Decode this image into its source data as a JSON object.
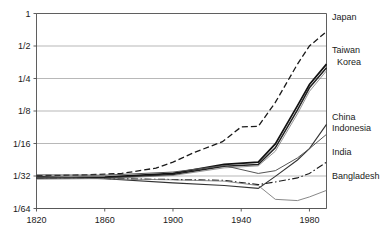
{
  "chart_data": {
    "type": "line",
    "title": "",
    "subtitle": "",
    "xlabel": "",
    "ylabel": "",
    "yscale": "log2",
    "xlim": [
      1820,
      1990
    ],
    "ylim": [
      0.015625,
      1
    ],
    "grid": true,
    "legend_position": "right-inline",
    "y_tick_labels": [
      "1",
      "1/2",
      "1/4",
      "1/8",
      "1/16",
      "1/32",
      "1/64"
    ],
    "y_tick_values": [
      1,
      0.5,
      0.25,
      0.125,
      0.0625,
      0.03125,
      0.015625
    ],
    "x_tick_labels": [
      "1820",
      "1860",
      "1900",
      "1940",
      "1980"
    ],
    "x_tick_values": [
      1820,
      1860,
      1900,
      1940,
      1980
    ],
    "series": [
      {
        "name": "Japan",
        "label": "Japan",
        "style": "dashed",
        "color": "#1a1a1a",
        "width": 1.3,
        "dash": "6,3",
        "label_x": 332,
        "label_y": 20,
        "x": [
          1820,
          1850,
          1870,
          1890,
          1900,
          1913,
          1929,
          1940,
          1950,
          1960,
          1973,
          1980,
          1990
        ],
        "y": [
          0.0315,
          0.032,
          0.033,
          0.037,
          0.042,
          0.052,
          0.065,
          0.089,
          0.09,
          0.15,
          0.34,
          0.5,
          0.68
        ]
      },
      {
        "name": "Taiwan",
        "label": "Taiwan",
        "style": "solid-heavy",
        "color": "#111111",
        "width": 1.7,
        "dash": "none",
        "label_x": 332,
        "label_y": 53,
        "x": [
          1820,
          1860,
          1900,
          1930,
          1950,
          1960,
          1973,
          1980,
          1990
        ],
        "y": [
          0.03,
          0.0305,
          0.033,
          0.04,
          0.042,
          0.062,
          0.14,
          0.22,
          0.34
        ]
      },
      {
        "name": "Korea",
        "label": "Korea",
        "style": "solid-heavy",
        "color": "#222222",
        "width": 1.5,
        "dash": "none",
        "label_x": 337,
        "label_y": 65,
        "x": [
          1820,
          1860,
          1900,
          1930,
          1950,
          1960,
          1973,
          1980,
          1990
        ],
        "y": [
          0.0298,
          0.03,
          0.0322,
          0.0385,
          0.04,
          0.057,
          0.128,
          0.205,
          0.315
        ]
      },
      {
        "name": "Korea-thin",
        "label": "",
        "style": "solid-thin",
        "color": "#7a7a7a",
        "width": 0.8,
        "dash": "none",
        "label_x": 0,
        "label_y": 0,
        "x": [
          1820,
          1860,
          1900,
          1930,
          1950,
          1960,
          1973,
          1980,
          1990
        ],
        "y": [
          0.0292,
          0.0296,
          0.0316,
          0.0372,
          0.0388,
          0.053,
          0.118,
          0.19,
          0.295
        ]
      },
      {
        "name": "China",
        "label": "China",
        "style": "solid",
        "color": "#333333",
        "width": 1.1,
        "dash": "none",
        "label_x": 332,
        "label_y": 120,
        "x": [
          1820,
          1860,
          1900,
          1930,
          1950,
          1960,
          1973,
          1980,
          1990
        ],
        "y": [
          0.031,
          0.0295,
          0.027,
          0.0255,
          0.024,
          0.031,
          0.044,
          0.056,
          0.094
        ]
      },
      {
        "name": "Indonesia",
        "label": "Indonesia",
        "style": "solid",
        "color": "#555555",
        "width": 1.0,
        "dash": "none",
        "label_x": 332,
        "label_y": 131,
        "x": [
          1820,
          1860,
          1900,
          1930,
          1950,
          1960,
          1973,
          1980,
          1990
        ],
        "y": [
          0.032,
          0.0318,
          0.034,
          0.039,
          0.033,
          0.035,
          0.046,
          0.056,
          0.076
        ]
      },
      {
        "name": "India",
        "label": "India",
        "style": "dash-dot",
        "color": "#1a1a1a",
        "width": 1.1,
        "dash": "7,2.5,1.5,2.5",
        "label_x": 332,
        "label_y": 155,
        "x": [
          1820,
          1860,
          1900,
          1930,
          1950,
          1960,
          1973,
          1980,
          1990
        ],
        "y": [
          0.03,
          0.0296,
          0.029,
          0.0285,
          0.026,
          0.0275,
          0.03,
          0.033,
          0.042
        ]
      },
      {
        "name": "Bangladesh",
        "label": "Bangladesh",
        "style": "solid-light",
        "color": "#7a7a7a",
        "width": 0.9,
        "dash": "none",
        "label_x": 332,
        "label_y": 179,
        "x": [
          1820,
          1860,
          1900,
          1930,
          1950,
          1960,
          1973,
          1980,
          1990
        ],
        "y": [
          0.03,
          0.0295,
          0.0288,
          0.028,
          0.0255,
          0.019,
          0.0185,
          0.02,
          0.023
        ]
      }
    ]
  }
}
